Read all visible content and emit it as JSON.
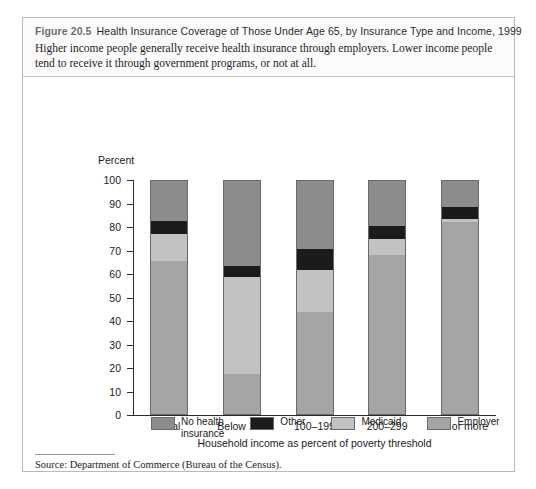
{
  "figure": {
    "number": "Figure 20.5",
    "title": "Health Insurance Coverage of Those Under Age 65, by Insurance Type and Income, 1999",
    "caption": "Higher income people generally receive health insurance through employers. Lower income people tend to receive it through government programs, or not at all.",
    "source": "Source: Department of Commerce (Bureau of the Census)."
  },
  "chart_data": {
    "type": "bar",
    "subtype": "stacked-column-100",
    "title": "Health Insurance Coverage of Those Under Age 65, by Insurance Type and Income, 1999",
    "xlabel": "Household income as percent of poverty threshold",
    "ylabel": "Percent",
    "ylim": [
      0,
      100
    ],
    "yticks": [
      0,
      10,
      20,
      30,
      40,
      50,
      60,
      70,
      80,
      90,
      100
    ],
    "grid": false,
    "legend_position": "bottom",
    "categories": [
      "Total",
      "Below 100",
      "100–199",
      "200–299",
      "300 or more"
    ],
    "series": [
      {
        "name": "Employer",
        "color": "#a5a5a5",
        "values": [
          66,
          17.5,
          44,
          68.5,
          82.5
        ]
      },
      {
        "name": "Medicaid",
        "color": "#c2c2c2",
        "values": [
          11.5,
          41.5,
          18,
          7,
          1.5
        ]
      },
      {
        "name": "Other",
        "color": "#1b1b1b",
        "values": [
          5.5,
          4.5,
          9,
          5.5,
          5
        ]
      },
      {
        "name": "No health insurance",
        "color": "#8c8c8c",
        "values": [
          17,
          36.5,
          29,
          19,
          11
        ]
      }
    ],
    "stack_order_bottom_to_top": [
      "Employer",
      "Medicaid",
      "Other",
      "No health insurance"
    ]
  },
  "legend": [
    {
      "label": "No health insurance",
      "color": "#8c8c8c"
    },
    {
      "label": "Other",
      "color": "#1b1b1b"
    },
    {
      "label": "Medicaid",
      "color": "#c2c2c2"
    },
    {
      "label": "Employer",
      "color": "#a5a5a5"
    }
  ]
}
